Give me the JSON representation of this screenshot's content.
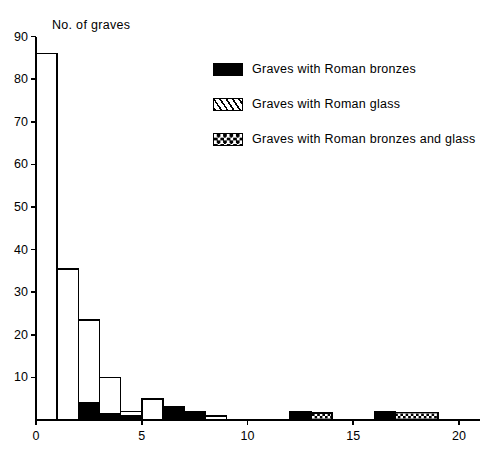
{
  "chart_data": {
    "type": "bar",
    "title": "",
    "ylabel": "No. of graves",
    "xlabel": "",
    "ylim": [
      0,
      90
    ],
    "xlim": [
      0,
      21
    ],
    "yticks": [
      0,
      10,
      20,
      30,
      40,
      50,
      60,
      70,
      80,
      90
    ],
    "xticks": [
      0,
      5,
      10,
      15,
      20
    ],
    "grid": false,
    "legend_position": "upper-right-inside",
    "bin_width": 1,
    "note": "Histogram of graves by number of Roman grave-goods; each bar is a stack of up to three fill categories.",
    "series": [
      {
        "name": "Graves with Roman bronzes",
        "fill": "solid-black"
      },
      {
        "name": "Graves with Roman glass",
        "fill": "hatched"
      },
      {
        "name": "Graves with Roman bronzes and glass",
        "fill": "checkered"
      }
    ],
    "bars": [
      {
        "x0": 0,
        "x1": 1,
        "total": 86,
        "segments": [
          {
            "fill": "plain",
            "value": 86
          }
        ]
      },
      {
        "x0": 1,
        "x1": 2,
        "total": 35.5,
        "segments": [
          {
            "fill": "plain",
            "value": 35.5
          }
        ]
      },
      {
        "x0": 2,
        "x1": 3,
        "total": 23.5,
        "segments": [
          {
            "fill": "solid-black",
            "value": 4
          },
          {
            "fill": "plain",
            "value": 19.5
          }
        ]
      },
      {
        "x0": 3,
        "x1": 4,
        "total": 10,
        "segments": [
          {
            "fill": "solid-black",
            "value": 1.5
          },
          {
            "fill": "plain",
            "value": 8.5
          }
        ]
      },
      {
        "x0": 4,
        "x1": 5,
        "total": 2,
        "segments": [
          {
            "fill": "solid-black",
            "value": 1
          },
          {
            "fill": "plain",
            "value": 1
          }
        ]
      },
      {
        "x0": 5,
        "x1": 6,
        "total": 5,
        "segments": [
          {
            "fill": "plain",
            "value": 5
          }
        ]
      },
      {
        "x0": 6,
        "x1": 7,
        "total": 3,
        "segments": [
          {
            "fill": "solid-black",
            "value": 3
          }
        ]
      },
      {
        "x0": 7,
        "x1": 8,
        "total": 2,
        "segments": [
          {
            "fill": "solid-black",
            "value": 2
          }
        ]
      },
      {
        "x0": 8,
        "x1": 9,
        "total": 1,
        "segments": [
          {
            "fill": "plain",
            "value": 1
          }
        ]
      },
      {
        "x0": 12,
        "x1": 13,
        "total": 2,
        "segments": [
          {
            "fill": "solid-black",
            "value": 2
          }
        ]
      },
      {
        "x0": 13,
        "x1": 14,
        "total": 1.6,
        "segments": [
          {
            "fill": "checkered",
            "value": 1.6
          }
        ]
      },
      {
        "x0": 16,
        "x1": 17,
        "total": 2,
        "segments": [
          {
            "fill": "solid-black",
            "value": 2
          }
        ]
      },
      {
        "x0": 17,
        "x1": 19,
        "total": 1.8,
        "segments": [
          {
            "fill": "checkered",
            "value": 1.8
          }
        ]
      }
    ]
  },
  "axis": {
    "y_title": "No. of graves",
    "y_tick_labels": [
      "90",
      "80",
      "70",
      "60",
      "50",
      "40",
      "30",
      "20",
      "10"
    ],
    "x_tick_labels": [
      "0",
      "5",
      "10",
      "15",
      "20"
    ]
  },
  "legend": {
    "items": [
      {
        "label": "Graves with Roman bronzes",
        "swatch": "solid-black-swatch"
      },
      {
        "label": "Graves with Roman glass",
        "swatch": "hatched-swatch"
      },
      {
        "label": "Graves with Roman bronzes and glass",
        "swatch": "checkered-swatch"
      }
    ]
  },
  "colors": {
    "ink": "#000000",
    "background": "#ffffff"
  }
}
